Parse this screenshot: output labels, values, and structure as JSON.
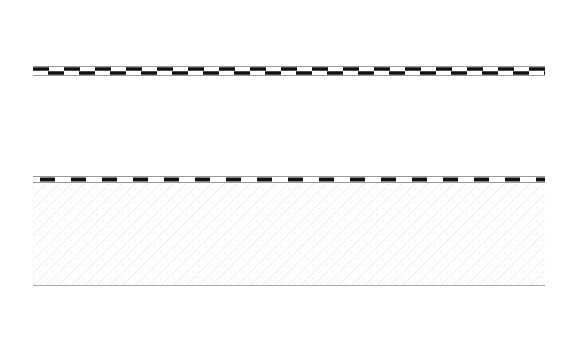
{
  "labels": {
    "top": "a",
    "bottom": "i"
  },
  "section": {
    "layers": [
      {
        "id": "cladding-panels",
        "description": "outer panels (three segments)"
      },
      {
        "id": "upper-membrane",
        "description": "double dashed membrane"
      },
      {
        "id": "insulation",
        "description": "soft insulation (loop pattern)"
      },
      {
        "id": "lower-membrane",
        "description": "dashed vapour barrier"
      },
      {
        "id": "concrete",
        "description": "concrete slab (diagonal hatch)"
      }
    ],
    "panels": [
      {
        "x": 33,
        "width": 105
      },
      {
        "x": 143,
        "width": 276
      },
      {
        "x": 424,
        "width": 121
      }
    ]
  },
  "colors": {
    "line": "#bbbbbb",
    "membrane": "#111111",
    "hatch": "#e2e2e2",
    "label": "#666666"
  }
}
